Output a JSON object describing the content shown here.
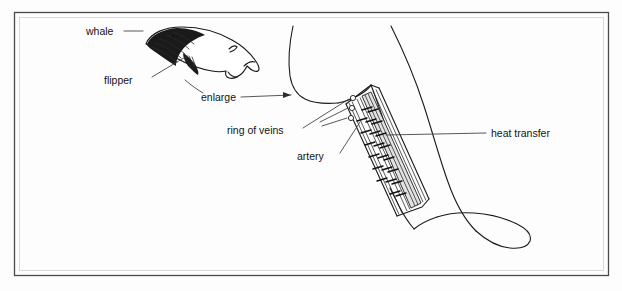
{
  "figure": {
    "background_color": "#fdfdfd",
    "ink_color": "#1b1b1b",
    "frame_color": "#4a4a4a",
    "band_fill_color": "#e2e2e2"
  },
  "labels": {
    "whale": "whale",
    "flipper": "flipper",
    "enlarge": "enlarge",
    "ring_of_veins": "ring of veins",
    "artery": "artery",
    "heat_transfer": "heat transfer"
  },
  "annotations": [
    {
      "name": "whale",
      "text": "whale",
      "leader": "dash",
      "points_to": "whale-illustration"
    },
    {
      "name": "flipper",
      "text": "flipper",
      "leader": "diagonal",
      "points_to": "whale-flipper"
    },
    {
      "name": "enlarge",
      "text": "enlarge",
      "leader": "arrow",
      "points_to": "enlarged-flipper"
    },
    {
      "name": "ring-of-veins",
      "text": "ring of veins",
      "leader": "diagonal",
      "points_to": "vein-circles"
    },
    {
      "name": "artery",
      "text": "artery",
      "leader": "diagonal",
      "points_to": "artery-channel"
    },
    {
      "name": "heat-transfer",
      "text": "heat transfer",
      "leader": "horizontal",
      "points_to": "heat-arrows"
    }
  ],
  "diagram_parts": {
    "vein_count": 3,
    "heat_arrow_count": 14,
    "artery_channel": "central shaded band",
    "enlarged_view": "cross-section of flipper base showing artery surrounded by ring of veins"
  }
}
